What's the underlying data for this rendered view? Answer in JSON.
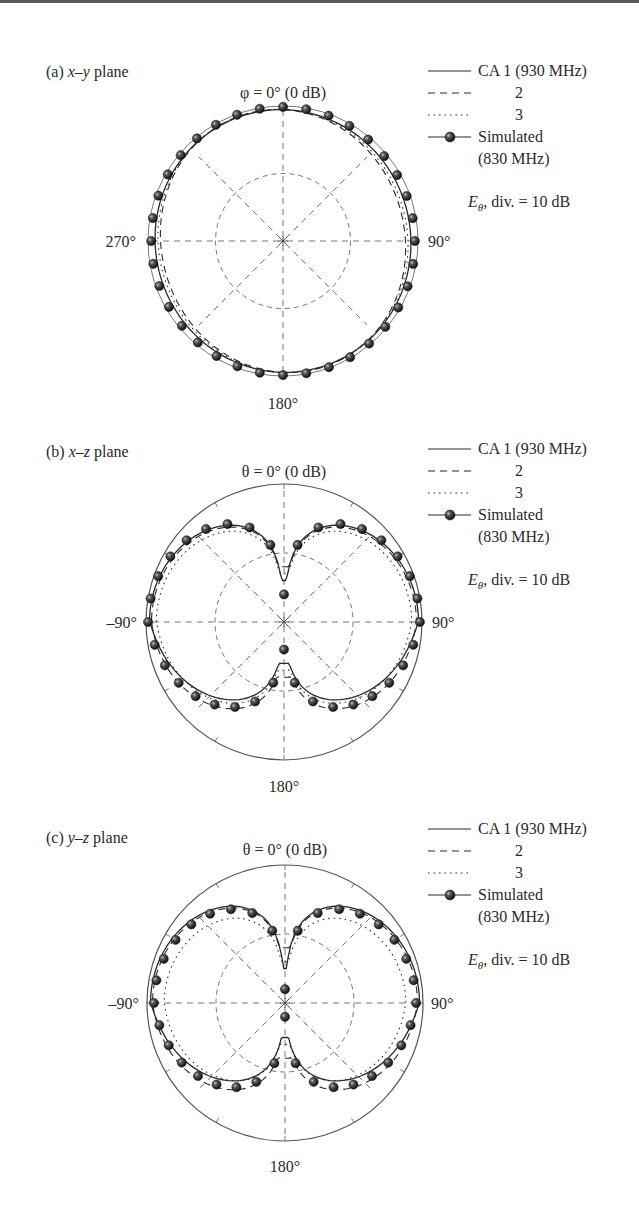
{
  "figure": {
    "panels": [
      {
        "id": "a",
        "title_prefix": "(a) ",
        "title_plane": "x–y",
        "title_suffix": " plane",
        "top_label": "φ = 0° (0 dB)",
        "left_label": "270°",
        "right_label": "90°",
        "bottom_label": "180°"
      },
      {
        "id": "b",
        "title_prefix": "(b) ",
        "title_plane": "x–z",
        "title_suffix": " plane",
        "top_label": "θ = 0° (0 dB)",
        "left_label": "–90°",
        "right_label": "90°",
        "bottom_label": "180°"
      },
      {
        "id": "c",
        "title_prefix": "(c) ",
        "title_plane": "y–z",
        "title_suffix": " plane",
        "top_label": "θ = 0° (0 dB)",
        "left_label": "–90°",
        "right_label": "90°",
        "bottom_label": "180°"
      }
    ],
    "legend": {
      "items": [
        {
          "style": "solid",
          "label": "CA 1 (930 MHz)"
        },
        {
          "style": "dashed",
          "label": "2"
        },
        {
          "style": "dotted",
          "label": "3"
        },
        {
          "style": "marker",
          "label": "Simulated",
          "label2": "(830 MHz)"
        }
      ],
      "note_symbol": "E",
      "note_sub": "θ",
      "note_text": ", div. = 10 dB"
    }
  },
  "chart_data": [
    {
      "type": "polar",
      "title": "(a) x–y plane",
      "angle_label_top": "φ = 0° (0 dB)",
      "angle_tick_labels": [
        "270°",
        "90°",
        "180°"
      ],
      "radial_unit": "dB",
      "radial_range": [
        -20,
        0
      ],
      "radial_division_dB": 10,
      "grid": true,
      "legend_position": "top-right",
      "series": [
        {
          "name": "CA 1 (930 MHz)",
          "style": "solid",
          "pattern": "omni",
          "level_dB": -0.8,
          "ripple_dB": 0.3
        },
        {
          "name": "CA 2",
          "style": "dashed",
          "pattern": "omni",
          "level_dB": -1.2,
          "ripple_dB": 0.8
        },
        {
          "name": "CA 3",
          "style": "dotted",
          "pattern": "omni",
          "level_dB": -1.0,
          "ripple_dB": 0.6
        },
        {
          "name": "Simulated (830 MHz)",
          "style": "marker",
          "pattern": "omni",
          "level_dB": -0.3,
          "ripple_dB": 0.2,
          "marker_step_deg": 10
        }
      ]
    },
    {
      "type": "polar",
      "title": "(b) x–z plane",
      "angle_label_top": "θ = 0° (0 dB)",
      "angle_tick_labels": [
        "–90°",
        "90°",
        "180°"
      ],
      "radial_unit": "dB",
      "radial_range": [
        -20,
        0
      ],
      "radial_division_dB": 10,
      "grid": true,
      "legend_position": "top-right",
      "series": [
        {
          "name": "CA 1 (930 MHz)",
          "style": "solid",
          "pattern": "dipole",
          "peak_dB": -0.5,
          "null_depth_dB": -14,
          "back_dB": -4.5
        },
        {
          "name": "CA 2",
          "style": "dashed",
          "pattern": "dipole",
          "peak_dB": -0.8,
          "null_depth_dB": -12,
          "back_dB": -2.5
        },
        {
          "name": "CA 3",
          "style": "dotted",
          "pattern": "dipole",
          "peak_dB": -1.5,
          "null_depth_dB": -13,
          "back_dB": -3.5
        },
        {
          "name": "Simulated (830 MHz)",
          "style": "marker",
          "pattern": "dipole",
          "peak_dB": -0.3,
          "null_depth_dB": -16,
          "back_dB": -3.0,
          "marker_step_deg": 10
        }
      ]
    },
    {
      "type": "polar",
      "title": "(c) y–z plane",
      "angle_label_top": "θ = 0° (0 dB)",
      "angle_tick_labels": [
        "–90°",
        "90°",
        "180°"
      ],
      "radial_unit": "dB",
      "radial_range": [
        -20,
        0
      ],
      "radial_division_dB": 10,
      "grid": true,
      "legend_position": "top-right",
      "series": [
        {
          "name": "CA 1 (930 MHz)",
          "style": "solid",
          "pattern": "dipole",
          "peak_dB": -0.5,
          "null_depth_dB": -15,
          "back_dB": -4.5
        },
        {
          "name": "CA 2",
          "style": "dashed",
          "pattern": "dipole",
          "peak_dB": -0.8,
          "null_depth_dB": -12,
          "back_dB": -2.5
        },
        {
          "name": "CA 3",
          "style": "dotted",
          "pattern": "dipole",
          "peak_dB": -2.5,
          "null_depth_dB": -14,
          "back_dB": -4.0
        },
        {
          "name": "Simulated (830 MHz)",
          "style": "marker",
          "pattern": "dipole",
          "peak_dB": -1.0,
          "null_depth_dB": -18,
          "back_dB": -3.0,
          "marker_step_deg": 10
        }
      ]
    }
  ]
}
